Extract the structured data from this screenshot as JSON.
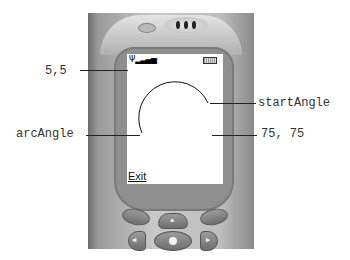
{
  "diagram": {
    "labels": {
      "origin": "5,5",
      "start_angle": "startAngle",
      "arc_angle": "arcAngle",
      "size": "75, 75"
    },
    "screen": {
      "softkey_left": "Exit"
    },
    "status_icons": [
      "antenna-signal-icon",
      "battery-icon"
    ],
    "keys": [
      "left-softkey",
      "up-key",
      "right-softkey",
      "left-key",
      "select-key",
      "right-key"
    ]
  }
}
